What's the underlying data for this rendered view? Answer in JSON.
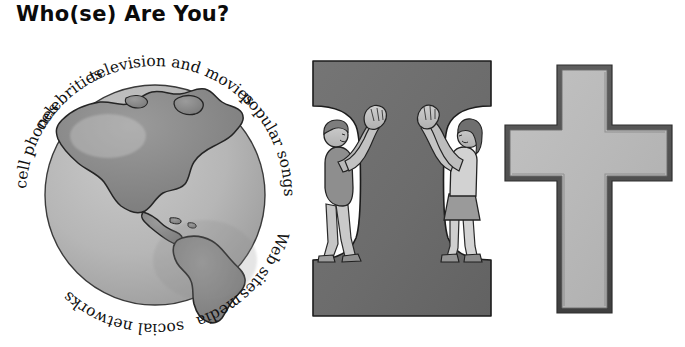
{
  "page": {
    "title": "Who(se) Are You?",
    "background_color": "#ffffff"
  },
  "globe": {
    "name": "world-globe-illustration",
    "ocean_color": "#b4b4b4",
    "land_color": "#8a8a8a",
    "outline_color": "#2b2b2b",
    "continents_shown": "The Americas",
    "ring_labels": [
      {
        "text": "cell phones",
        "angle_deg": 205
      },
      {
        "text": "celebrities",
        "angle_deg": 250
      },
      {
        "text": "television and movies",
        "angle_deg": 305
      },
      {
        "text": "popular songs",
        "angle_deg": 15
      },
      {
        "text": "Web sites",
        "angle_deg": 62
      },
      {
        "text": "media",
        "angle_deg": 95
      },
      {
        "text": "social networks",
        "angle_deg": 140
      }
    ]
  },
  "letter_i": {
    "name": "capital-letter-i-illustration",
    "glyph": "I",
    "fill_color": "#6e6e6e",
    "outline_color": "#1e1e1e",
    "figures": [
      {
        "name": "boy-figure",
        "side": "left",
        "pose": "arms-raised",
        "skin_color": "#bdbdbd",
        "shirt_color": "#8e8e8e",
        "pants_color": "#c6c6c6"
      },
      {
        "name": "girl-figure",
        "side": "right",
        "pose": "arms-raised",
        "skin_color": "#c2c2c2",
        "shirt_color": "#d2d2d2",
        "skirt_color": "#9a9a9a"
      }
    ]
  },
  "cross": {
    "name": "christian-cross-illustration",
    "fill_color": "#b8b8b8",
    "outline_color": "#4a4a4a"
  }
}
